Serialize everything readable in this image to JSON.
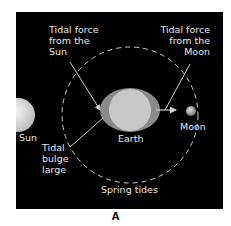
{
  "diagram": {
    "title": "Spring tides",
    "caption": "A",
    "labels": {
      "sun_force": [
        "Tidal force",
        "from the",
        "Sun"
      ],
      "moon_force": [
        "Tidal force",
        "from the",
        "Moon"
      ],
      "bulge": [
        "Tidal",
        "bulge",
        "large"
      ],
      "sun": "Sun",
      "earth": "Earth",
      "moon": "Moon"
    },
    "colors": {
      "background": "#000000",
      "text": "#e8e8e8",
      "earth": "#c8c8c8",
      "bulge": "#8a8a8a",
      "orbit": "#d0d0d0"
    }
  }
}
